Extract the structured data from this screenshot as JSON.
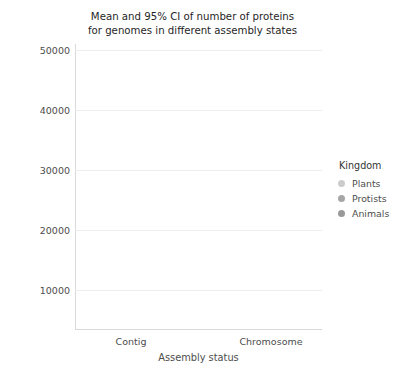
{
  "chart_data": {
    "type": "line",
    "title": "Mean and 95% CI of number of proteins for genomes in different assembly states",
    "title_lines": [
      "Mean and 95% CI of number of proteins",
      "for genomes in different assembly states"
    ],
    "xlabel": "Assembly status",
    "ylabel": "Number of proteins",
    "categories": [
      "Contig",
      "Chromosome"
    ],
    "xtick_labels": [
      "Contig",
      "Chromosome"
    ],
    "ytick_labels": [
      "10000",
      "20000",
      "30000",
      "40000",
      "50000"
    ],
    "yticks": [
      10000,
      20000,
      30000,
      40000,
      50000
    ],
    "ylim": [
      2500,
      52000
    ],
    "grid": "horizontal",
    "legend_title": "Kingdom",
    "legend_position": "right",
    "series": [
      {
        "name": "Plants",
        "color": "#cccccc",
        "values": [
          29200,
          44800
        ],
        "ci_low": [
          10500,
          41200
        ],
        "ci_high": [
          48200,
          49300
        ]
      },
      {
        "name": "Protists",
        "color": "#a6a6a6",
        "values": [
          18000,
          41100
        ],
        "ci_low": [
          10300,
          37800
        ],
        "ci_high": [
          26700,
          44400
        ]
      },
      {
        "name": "Animals",
        "color": "#999999",
        "values": [
          14000,
          5400
        ],
        "ci_low": [
          13000,
          5400
        ],
        "ci_high": [
          15200,
          5400
        ]
      }
    ]
  },
  "legend": {
    "title": "Kingdom",
    "items": [
      {
        "label": "Plants",
        "color": "#cccccc"
      },
      {
        "label": "Protists",
        "color": "#a6a6a6"
      },
      {
        "label": "Animals",
        "color": "#999999"
      }
    ]
  },
  "axes": {
    "y_label": "Number of proteins",
    "x_label": "Assembly status",
    "y_ticks": [
      "10000",
      "20000",
      "30000",
      "40000",
      "50000"
    ],
    "x_ticks": [
      "Contig",
      "Chromosome"
    ]
  },
  "colors": {
    "grid": "#ededed",
    "spine": "#d9d9d9",
    "text": "#4d4d4d",
    "title_text": "#262626",
    "background": "#ffffff"
  }
}
